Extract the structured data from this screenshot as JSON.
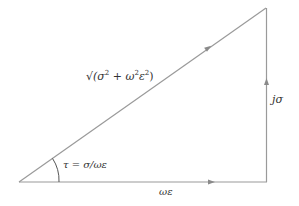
{
  "diagram": {
    "type": "right-triangle-phasor",
    "labels": {
      "hypotenuse": {
        "radical": "√",
        "open": "(σ",
        "sq1": "2",
        "plus": " + ω",
        "sq2": "2",
        "eps": "ε",
        "sq3": "2",
        "close": ")"
      },
      "vertical": "jσ",
      "horizontal": "ωε",
      "angle": "τ = σ/ωε"
    },
    "colors": {
      "line": "#9a9a9a",
      "arrow": "#8a8a8a",
      "text": "#333333"
    }
  }
}
